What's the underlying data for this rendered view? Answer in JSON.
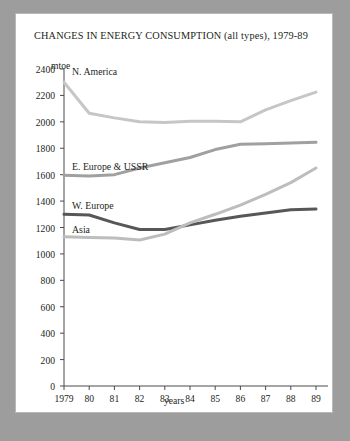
{
  "chart_data": {
    "type": "line",
    "title": "CHANGES IN ENERGY CONSUMPTION (all types), 1979-89",
    "xlabel": "years",
    "ylabel": "mtoe",
    "ylim": [
      0,
      2400
    ],
    "ytick_labels": [
      "2400",
      "2200",
      "2000",
      "1800",
      "1600",
      "1400",
      "1200",
      "1000",
      "800",
      "600",
      "400",
      "200",
      "0"
    ],
    "yticks": [
      2400,
      2200,
      2000,
      1800,
      1600,
      1400,
      1200,
      1000,
      800,
      600,
      400,
      200,
      0
    ],
    "grid": false,
    "legend_position": "inline-labels",
    "categories": [
      "1979",
      "80",
      "81",
      "82",
      "83",
      "84",
      "85",
      "86",
      "87",
      "88",
      "89"
    ],
    "x": [
      1979,
      1980,
      1981,
      1982,
      1983,
      1984,
      1985,
      1986,
      1987,
      1988,
      1989
    ],
    "series": [
      {
        "name": "N. America",
        "color": "#c6c6c6",
        "values": [
          2300,
          2065,
          2030,
          2000,
          1995,
          2005,
          2005,
          2000,
          2090,
          2160,
          2225
        ]
      },
      {
        "name": "E. Europe & USSR",
        "color": "#a0a0a0",
        "values": [
          1595,
          1590,
          1600,
          1650,
          1690,
          1730,
          1790,
          1830,
          1835,
          1840,
          1845
        ]
      },
      {
        "name": "W. Europe",
        "color": "#575757",
        "values": [
          1300,
          1295,
          1235,
          1185,
          1185,
          1220,
          1255,
          1285,
          1310,
          1335,
          1340
        ]
      },
      {
        "name": "Asia",
        "color": "#bdbdbd",
        "values": [
          1130,
          1125,
          1120,
          1105,
          1150,
          1235,
          1300,
          1370,
          1450,
          1540,
          1650
        ]
      }
    ]
  }
}
